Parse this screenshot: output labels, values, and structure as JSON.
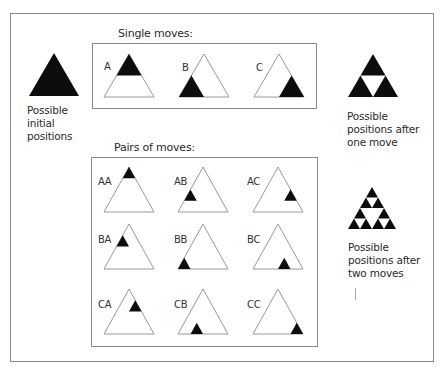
{
  "colors": {
    "fill": "#0d0d0d",
    "stroke": "#9a9a9a",
    "frame": "#8a8a8a",
    "background": "#ffffff"
  },
  "single_moves": {
    "title": "Single moves:",
    "items": [
      {
        "label": "A",
        "position": "top"
      },
      {
        "label": "B",
        "position": "bottom-left"
      },
      {
        "label": "C",
        "position": "bottom-right"
      }
    ]
  },
  "pairs_of_moves": {
    "title": "Pairs of moves:",
    "items": [
      {
        "label": "AA",
        "row": 0,
        "k": 0
      },
      {
        "label": "AB",
        "row": 2,
        "k": 0
      },
      {
        "label": "AC",
        "row": 2,
        "k": 2
      },
      {
        "label": "BA",
        "row": 1,
        "k": 0
      },
      {
        "label": "BB",
        "row": 3,
        "k": 0
      },
      {
        "label": "BC",
        "row": 3,
        "k": 2
      },
      {
        "label": "CA",
        "row": 1,
        "k": 1
      },
      {
        "label": "CB",
        "row": 3,
        "k": 1
      },
      {
        "label": "CC",
        "row": 3,
        "k": 3
      }
    ]
  },
  "captions": {
    "initial": [
      "Possible",
      "initial",
      "positions"
    ],
    "one_move": [
      "Possible",
      "positions after",
      "one move"
    ],
    "two_moves": [
      "Possible",
      "positions after",
      "two moves"
    ]
  }
}
